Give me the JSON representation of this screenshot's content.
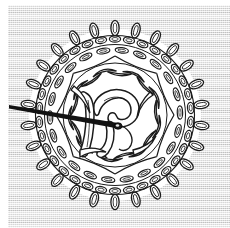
{
  "image": {
    "title": "Crocheted picot-edged doily with threaded needle",
    "subject": "doily",
    "technique": "line drawing / engraving",
    "background_color": "#dcdcdc",
    "paper_color": "#ffffff",
    "ink_color": "#1b1b1b",
    "margin_left_px": 8,
    "margin_top_px": 5,
    "width_px": 230,
    "height_px": 228
  },
  "doily": {
    "label": "doily",
    "center_x": 115,
    "center_y": 115,
    "outer_picot_radius": 94,
    "outer_ring_radius": 80,
    "mid_ring_radius": 68,
    "inner_ring_radius": 50,
    "picot_count": 26,
    "outer_ring_loop_count": 34,
    "mid_braid_loop_count": 22,
    "interior_color": "#ffffff"
  },
  "center_motif": {
    "label": "scroll monogram motif",
    "shape": "stylized letter R scroll",
    "x": 110,
    "y": 118
  },
  "needle": {
    "label": "sewing needle",
    "tip_x": 9,
    "tip_y": 106,
    "eye_x": 118,
    "eye_y": 126,
    "color": "#121212",
    "length_px": 111,
    "head_radius": 4
  }
}
